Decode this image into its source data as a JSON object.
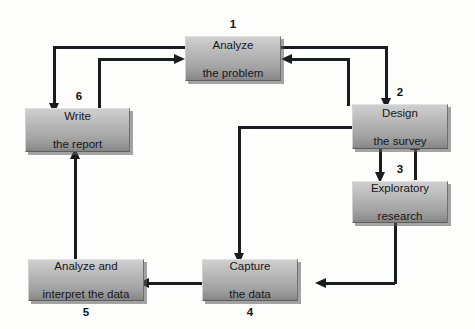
{
  "diagram": {
    "background_color": "#fdfdfc",
    "line_color": "#1b1c1f",
    "box_fill_top": "#cfcfcf",
    "box_fill_bottom": "#858585",
    "nodes": [
      {
        "id": "analyze-problem",
        "number": "1",
        "line1": "Analyze",
        "line2": "the problem"
      },
      {
        "id": "design-survey",
        "number": "2",
        "line1": "Design",
        "line2": "the survey"
      },
      {
        "id": "exploratory-research",
        "number": "3",
        "line1": "Exploratory",
        "line2": "research"
      },
      {
        "id": "capture-data",
        "number": "4",
        "line1": "Capture",
        "line2": "the data"
      },
      {
        "id": "analyze-interpret",
        "number": "5",
        "line1": "Analyze and",
        "line2": "interpret the data"
      },
      {
        "id": "write-report",
        "number": "6",
        "line1": "Write",
        "line2": "the report"
      }
    ],
    "connections": [
      {
        "from": "analyze-problem",
        "to": "design-survey",
        "style": "right-then-down"
      },
      {
        "from": "design-survey",
        "to": "analyze-problem",
        "style": "up-then-left"
      },
      {
        "from": "analyze-problem",
        "to": "write-report",
        "style": "left-then-down"
      },
      {
        "from": "write-report",
        "to": "analyze-problem",
        "style": "up-then-right"
      },
      {
        "from": "design-survey",
        "to": "exploratory-research",
        "style": "down"
      },
      {
        "from": "exploratory-research",
        "to": "design-survey",
        "style": "up"
      },
      {
        "from": "design-survey",
        "to": "capture-data",
        "style": "left-then-down"
      },
      {
        "from": "exploratory-research",
        "to": "capture-data",
        "style": "down-then-left"
      },
      {
        "from": "capture-data",
        "to": "analyze-interpret",
        "style": "left"
      },
      {
        "from": "analyze-interpret",
        "to": "write-report",
        "style": "up"
      }
    ]
  }
}
